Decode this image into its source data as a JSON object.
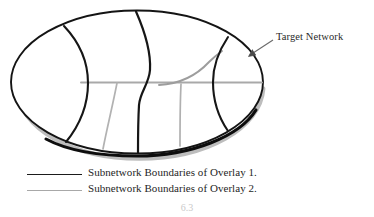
{
  "figure": {
    "type": "diagram",
    "title_annotation": "Target Network",
    "caption_partial": "6.3"
  },
  "annotations": [
    {
      "id": "target-network",
      "label": "Target Network",
      "points_to": "ellipse-outer-boundary",
      "arrow": "leader-line-with-arrowhead"
    }
  ],
  "legend": {
    "rows": [
      {
        "swatch": "solid-black-line",
        "color": "#1b1b1b",
        "label": "Subnetwork Boundaries of Overlay 1."
      },
      {
        "swatch": "solid-gray-line",
        "color": "#a8a8a8",
        "label": "Subnetwork Boundaries of Overlay 2."
      }
    ]
  },
  "colors": {
    "overlay1": "#1b1b1b",
    "overlay2": "#a8a8a8",
    "network_boundary": "#141414",
    "background": "#ffffff",
    "text": "#262626"
  },
  "geometry": {
    "ellipse": {
      "cx": 137,
      "cy": 82,
      "rx": 127,
      "ry": 72
    },
    "overlay1_boundaries": [
      "left-arc-curve",
      "center-s-curve",
      "right-arc-curve"
    ],
    "overlay2_boundaries": [
      "horizontal-midline",
      "left-slanted-descender",
      "center-descender",
      "right-rising-curve"
    ]
  }
}
